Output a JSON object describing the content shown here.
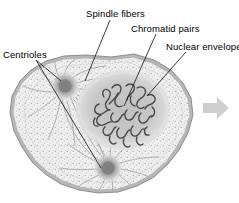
{
  "figure": {
    "type": "biology-diagram",
    "background_color": "#ffffff"
  },
  "labels": [
    {
      "id": "spindle",
      "text": "Spindle fibers",
      "x": 86,
      "y": 8
    },
    {
      "id": "chromatid",
      "text": "Chromatid pairs",
      "x": 131,
      "y": 23
    },
    {
      "id": "nuclear",
      "text": "Nuclear envelope",
      "x": 166,
      "y": 41
    },
    {
      "id": "centrioles",
      "text": "Centrioles",
      "x": 3,
      "y": 49
    }
  ],
  "leader_lines": [
    {
      "from_label": "spindle",
      "x1": 110,
      "y1": 20,
      "x2": 85,
      "y2": 81
    },
    {
      "from_label": "chromatid",
      "x1": 156,
      "y1": 34,
      "x2": 124,
      "y2": 106
    },
    {
      "from_label": "nuclear",
      "x1": 186,
      "y1": 52,
      "x2": 147,
      "y2": 96
    },
    {
      "from_label": "centrioles",
      "x1": 35,
      "y1": 60,
      "x2": 60,
      "y2": 80
    },
    {
      "from_label": "centrioles",
      "x1": 35,
      "y1": 60,
      "x2": 101,
      "y2": 168
    }
  ],
  "structures": {
    "cell_membrane": {
      "name": "cell membrane",
      "color": "#a8a8a8"
    },
    "cytoplasm": {
      "name": "cytoplasm",
      "color": "#eeeeee"
    },
    "nucleus": {
      "name": "nuclear region",
      "color": "#c6c6c6",
      "cx": 123,
      "cy": 110,
      "rx": 44,
      "ry": 37
    },
    "chromatids": {
      "name": "chromatid pairs",
      "color": "#4a4a4a"
    },
    "centriole_top": {
      "name": "upper centriole",
      "cx": 65,
      "cy": 86,
      "r": 13,
      "color": "#8d8d8d"
    },
    "centriole_bottom": {
      "name": "lower centriole",
      "cx": 108,
      "cy": 168,
      "r": 13,
      "color": "#8d8d8d"
    },
    "spindle_fibers": {
      "name": "spindle fibers",
      "color": "#9a9a9a"
    }
  },
  "arrow": {
    "name": "next-stage-arrow",
    "direction": "right",
    "color": "#cfcfcf",
    "x": 203,
    "y": 97,
    "width": 26,
    "height": 22
  }
}
